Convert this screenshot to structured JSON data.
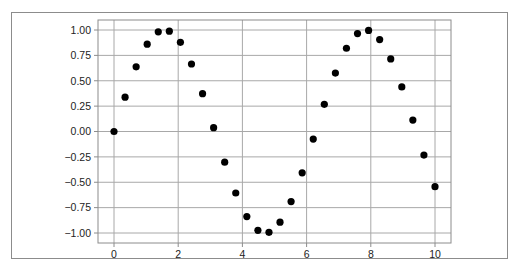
{
  "chart_data": {
    "type": "scatter",
    "title": "",
    "xlabel": "",
    "ylabel": "",
    "xlim": [
      -0.5,
      10.5
    ],
    "ylim": [
      -1.1,
      1.1
    ],
    "grid": true,
    "legend": null,
    "xticks": [
      "0",
      "2",
      "4",
      "6",
      "8",
      "10"
    ],
    "yticks": [
      "1.00",
      "0.75",
      "0.50",
      "0.25",
      "0.00",
      "−0.25",
      "−0.50",
      "−0.75",
      "−1.00"
    ],
    "series": [
      {
        "name": "sin(x)",
        "marker": "circle",
        "color": "#000000",
        "x": [
          0.0,
          0.345,
          0.69,
          1.034,
          1.379,
          1.724,
          2.069,
          2.414,
          2.759,
          3.103,
          3.448,
          3.793,
          4.138,
          4.483,
          4.828,
          5.172,
          5.517,
          5.862,
          6.207,
          6.552,
          6.897,
          7.241,
          7.586,
          7.931,
          8.276,
          8.621,
          8.966,
          9.31,
          9.655,
          10.0
        ],
        "y": [
          0.0,
          0.338,
          0.637,
          0.86,
          0.982,
          0.988,
          0.879,
          0.665,
          0.373,
          0.038,
          -0.302,
          -0.606,
          -0.838,
          -0.974,
          -0.993,
          -0.893,
          -0.69,
          -0.407,
          -0.075,
          0.268,
          0.576,
          0.82,
          0.965,
          0.996,
          0.906,
          0.715,
          0.439,
          0.113,
          -0.232,
          -0.544
        ]
      }
    ]
  }
}
